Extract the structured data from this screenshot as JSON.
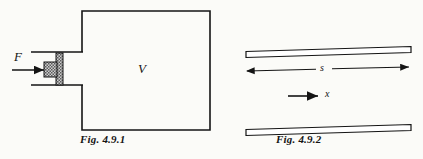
{
  "page": {
    "background_color": "#fbfbf8",
    "ink_color": "#141414",
    "width": 423,
    "height": 159
  },
  "figures": [
    {
      "id": "fig-4-9-1",
      "caption": "Fig. 4.9.1",
      "description": "Gas chamber with piston driven by force F",
      "labels": {
        "force": "F",
        "volume": "V"
      },
      "geometry": {
        "chamber": {
          "x": 82,
          "y": 11,
          "width": 128,
          "height": 119
        },
        "neck_top_y": 52,
        "neck_bottom_y": 85,
        "neck_left_x": 31,
        "piston_stem": {
          "x": 56,
          "y": 53,
          "width": 7,
          "height": 32
        },
        "piston_head": {
          "x": 44,
          "y": 62,
          "width": 12,
          "height": 14
        },
        "force_arrow": {
          "x1": 12,
          "y1": 70,
          "x2": 45,
          "y2": 70
        }
      }
    },
    {
      "id": "fig-4-9-2",
      "caption": "Fig. 4.9.2",
      "description": "Two parallel plates separated by distance s with displacement direction x",
      "labels": {
        "separation": "s",
        "displacement": "x"
      },
      "geometry": {
        "top_plate": {
          "x1": 246,
          "y1": 51,
          "x2": 411,
          "y2": 46,
          "thickness": 6
        },
        "bottom_plate": {
          "x1": 246,
          "y1": 129,
          "x2": 411,
          "y2": 124,
          "thickness": 6
        },
        "separation_arrow": {
          "x1": 245,
          "y1": 70,
          "x2": 410,
          "y2": 70
        },
        "displacement_arrow": {
          "x1": 288,
          "y1": 96,
          "x2": 320,
          "y2": 96
        }
      }
    }
  ]
}
